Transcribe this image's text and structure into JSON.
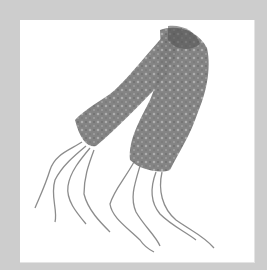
{
  "image": {
    "description": "Gray crocheted lace scarf with wavy fringe, folded in an inverted V shape on a white background inside a light gray frame",
    "colors": {
      "frame": "#cdcdcd",
      "panel": "#ffffff",
      "scarf": "#7a7a7a",
      "scarf_dark": "#555555",
      "fringe": "#8c8c8c"
    }
  }
}
